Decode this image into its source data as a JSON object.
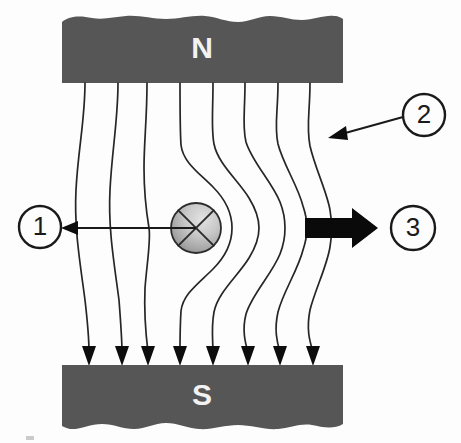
{
  "diagram": {
    "type": "physics-field-diagram",
    "background_color": "#fdfdfd",
    "magnets": {
      "north": {
        "label": "N",
        "name": "north-pole-block",
        "fill": "#565656",
        "label_color": "#f2f2f2",
        "x": 62,
        "y": 15,
        "width": 281,
        "height": 68,
        "torn_edge": "top"
      },
      "south": {
        "label": "S",
        "name": "south-pole-block",
        "fill": "#565656",
        "label_color": "#f2f2f2",
        "x": 62,
        "y": 365,
        "width": 281,
        "height": 67,
        "torn_edge": "bottom"
      }
    },
    "conductor": {
      "name": "current-into-page-conductor",
      "symbol": "cross",
      "meaning": "current into page",
      "cx": 196,
      "cy": 228,
      "r": 25,
      "fill_light": "#d8d8d8",
      "fill_dark": "#8e8e8e",
      "stroke": "#2b2b2b"
    },
    "force_arrow": {
      "name": "force-arrow",
      "direction": "right",
      "color": "#0a0a0a",
      "x_start": 305,
      "x_end": 378,
      "y": 228,
      "shaft_half_height": 10,
      "head_half_height": 20,
      "head_length": 26
    },
    "field_lines": {
      "name": "magnetic-field-lines",
      "count": 8,
      "direction": "north-to-south",
      "stroke": "#262626",
      "stroke_width": 1.7,
      "top_x": [
        85,
        118,
        147,
        180,
        213,
        245,
        278,
        310
      ],
      "bottom_x": [
        89,
        122,
        148,
        180,
        213,
        248,
        280,
        313
      ],
      "top_y": 83,
      "bottom_y": 362
    },
    "callouts": [
      {
        "name": "callout-1",
        "label": "1",
        "cx": 40,
        "cy": 227,
        "r": 21,
        "leader_from": {
          "x": 196,
          "y": 228
        },
        "leader_to": {
          "x": 63,
          "y": 228
        },
        "arrow_direction": "left",
        "points_at": "current-into-page-conductor"
      },
      {
        "name": "callout-2",
        "label": "2",
        "cx": 424,
        "cy": 115,
        "r": 21,
        "leader_from": {
          "x": 403,
          "y": 118
        },
        "leader_to": {
          "x": 331,
          "y": 137
        },
        "arrow_direction": "down-left",
        "points_at": "magnetic-field-lines"
      },
      {
        "name": "callout-3",
        "label": "3",
        "cx": 413,
        "cy": 228,
        "r": 22,
        "leader_from": null,
        "leader_to": null,
        "arrow_direction": "none",
        "points_at": "force-arrow"
      }
    ],
    "artifact": {
      "name": "scan-artifact-mark",
      "x": 26,
      "y": 436,
      "width": 8,
      "height": 5,
      "color": "#b5b5b5"
    }
  }
}
